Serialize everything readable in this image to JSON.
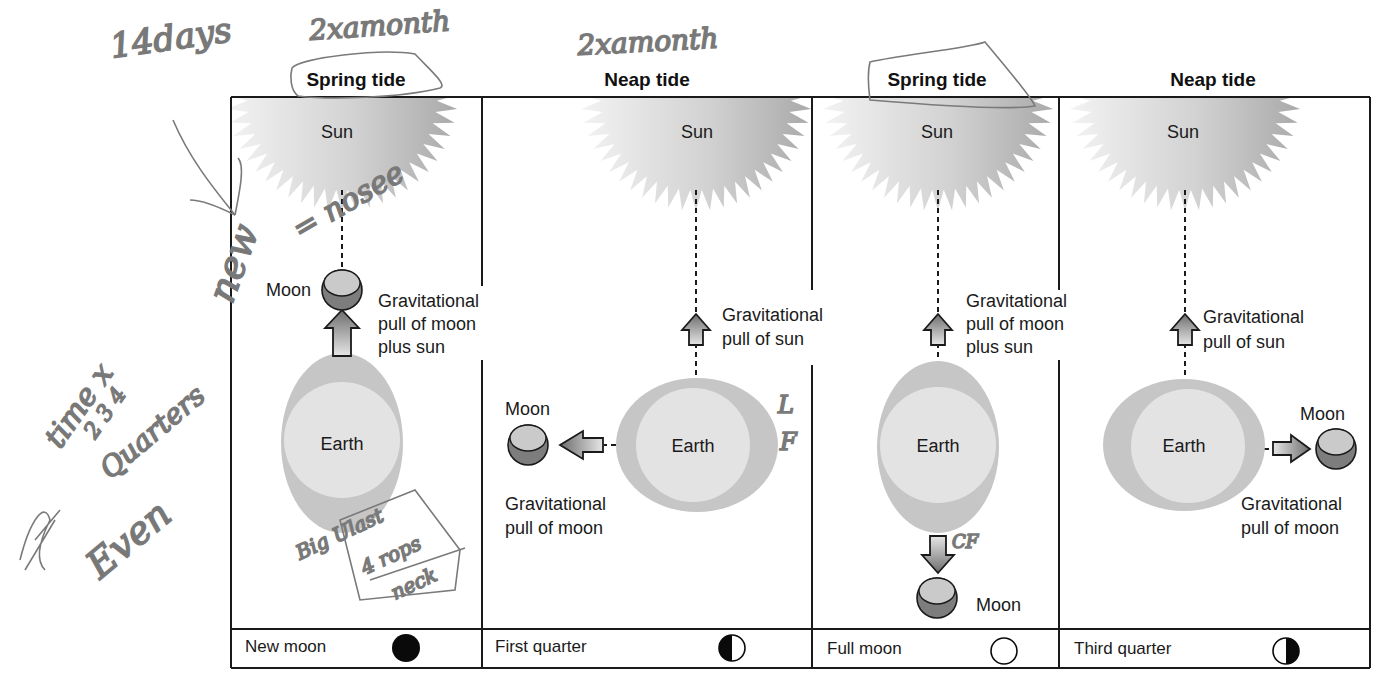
{
  "diagram": {
    "panels": [
      {
        "title": "Spring tide",
        "sun_label": "Sun",
        "earth_label": "Earth",
        "moon_label": "Moon",
        "moon_position": "between-earth-and-sun",
        "pull_labels": [
          "Gravitational",
          "pull of moon",
          "plus sun"
        ],
        "phase_label": "New moon",
        "phase_icon": "new-moon-icon"
      },
      {
        "title": "Neap tide",
        "sun_label": "Sun",
        "earth_label": "Earth",
        "moon_label": "Moon",
        "moon_position": "left-of-earth",
        "sun_pull_labels": [
          "Gravitational",
          "pull of sun"
        ],
        "moon_pull_labels": [
          "Gravitational",
          "pull of moon"
        ],
        "phase_label": "First quarter",
        "phase_icon": "first-quarter-moon-icon"
      },
      {
        "title": "Spring tide",
        "sun_label": "Sun",
        "earth_label": "Earth",
        "moon_label": "Moon",
        "moon_position": "opposite-sun",
        "pull_labels": [
          "Gravitational",
          "pull of moon",
          "plus sun"
        ],
        "phase_label": "Full moon",
        "phase_icon": "full-moon-icon"
      },
      {
        "title": "Neap tide",
        "sun_label": "Sun",
        "earth_label": "Earth",
        "moon_label": "Moon",
        "moon_position": "right-of-earth",
        "sun_pull_labels": [
          "Gravitational",
          "pull of sun"
        ],
        "moon_pull_labels": [
          "Gravitational",
          "pull of moon"
        ],
        "phase_label": "Third quarter",
        "phase_icon": "third-quarter-moon-icon"
      }
    ],
    "colors": {
      "sun_light": "#eeeeee",
      "sun_dark": "#a8a8a8",
      "earth_bulge": "#c4c4c4",
      "earth_core": "#e2e2e2",
      "moon_light": "#c8c8c8",
      "moon_dark": "#7a7a7a",
      "line": "#1a1a1a",
      "handwriting": "#7a7a7a"
    }
  },
  "annotations": {
    "top_left": "14days",
    "top_spring": "2xamonth",
    "top_neap": "2xamonth",
    "new_equals": "new = nosee",
    "side_1": "time 1 2 3 4",
    "side_2": "Quarters",
    "side_3": "Even",
    "box_note": [
      "Big Ulast",
      "4 rops",
      "neck"
    ],
    "neap_side": [
      "L",
      "F"
    ],
    "full_side": "CF"
  }
}
